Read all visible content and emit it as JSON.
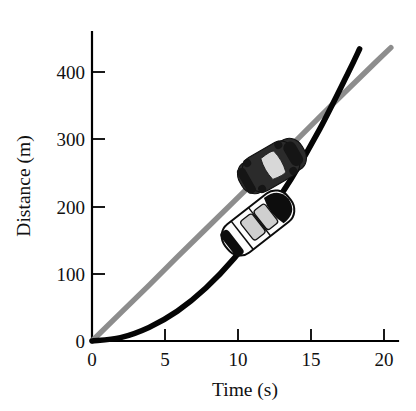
{
  "figure": {
    "background_color": "#ffffff",
    "name": "distance-vs-time-plot"
  },
  "chart_data": {
    "type": "line",
    "title": "",
    "xlabel": "Time (s)",
    "ylabel": "Distance (m)",
    "xlim": [
      0,
      21.5
    ],
    "ylim": [
      0,
      455
    ],
    "xticks": [
      0,
      5,
      10,
      15,
      20
    ],
    "xticklabels": [
      "0",
      "5",
      "10",
      "15",
      "20"
    ],
    "yticks": [
      0,
      100,
      200,
      300,
      400
    ],
    "yticklabels": [
      "0",
      "100",
      "200",
      "300",
      "400"
    ],
    "grid": false,
    "legend": "none",
    "series": [
      {
        "name": "constant-velocity",
        "color": "#8d8d8d",
        "shape": "straight line",
        "x": [
          0,
          2,
          4,
          6,
          8,
          10,
          12,
          14,
          16,
          18,
          20,
          21
        ],
        "values": [
          0,
          41,
          82,
          124,
          165,
          206,
          247,
          288,
          330,
          371,
          412,
          432
        ]
      },
      {
        "name": "uniform-acceleration",
        "color": "#050505",
        "shape": "parabola",
        "x": [
          0,
          2,
          4,
          6,
          8,
          10,
          12,
          14,
          16,
          18,
          18.8
        ],
        "values": [
          0,
          5,
          20,
          44,
          78,
          122,
          176,
          239,
          312,
          395,
          430
        ]
      }
    ],
    "annotations": [
      {
        "name": "dark-car-sprite",
        "label": "dark car on constant velocity line",
        "x": 12.0,
        "y": 270
      },
      {
        "name": "light-car-sprite",
        "label": "white car on accelerating curve",
        "x": 12.5,
        "y": 185
      }
    ],
    "crossing_point": {
      "x": 17.3,
      "y": 357
    }
  },
  "axes": {
    "x_title": "Time (s)",
    "y_title": "Distance (m)",
    "x_tick_labels": [
      "0",
      "5",
      "10",
      "15",
      "20"
    ],
    "y_tick_labels": [
      "0",
      "100",
      "200",
      "300",
      "400"
    ]
  },
  "colors": {
    "gray_series": "#8d8d8d",
    "black_series": "#050505",
    "axis": "#000000",
    "background": "#ffffff"
  }
}
